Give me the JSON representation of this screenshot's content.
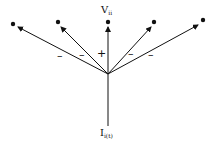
{
  "diagram": {
    "top_label": {
      "main": "V",
      "sub": "ii"
    },
    "bottom_label": {
      "main": "I",
      "sub": "i(t)"
    },
    "center": [
      108,
      74
    ],
    "branches": [
      {
        "tip": [
          13,
          24
        ],
        "sign": "–"
      },
      {
        "tip": [
          58,
          22
        ],
        "sign": "–"
      },
      {
        "tip": [
          108,
          22
        ],
        "sign": "+"
      },
      {
        "tip": [
          154,
          22
        ],
        "sign": "–"
      },
      {
        "tip": [
          203,
          20
        ],
        "sign": "–"
      }
    ],
    "input_line": {
      "from": [
        108,
        126
      ],
      "to": [
        108,
        74
      ]
    }
  }
}
